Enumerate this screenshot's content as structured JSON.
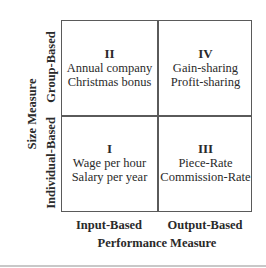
{
  "diagram": {
    "y_axis": {
      "title": "Size Measure",
      "top_label": "Group-Based",
      "bottom_label": "Individual-Based"
    },
    "x_axis": {
      "title": "Performance Measure",
      "left_label": "Input-Based",
      "right_label": "Output-Based"
    },
    "quadrants": {
      "top_left": {
        "numeral": "II",
        "line1": "Annual company",
        "line2": "Christmas bonus"
      },
      "top_right": {
        "numeral": "IV",
        "line1": "Gain-sharing",
        "line2": "Profit-sharing"
      },
      "bottom_left": {
        "numeral": "I",
        "line1": "Wage per hour",
        "line2": "Salary per year"
      },
      "bottom_right": {
        "numeral": "III",
        "line1": "Piece-Rate",
        "line2": "Commission-Rate"
      }
    }
  }
}
